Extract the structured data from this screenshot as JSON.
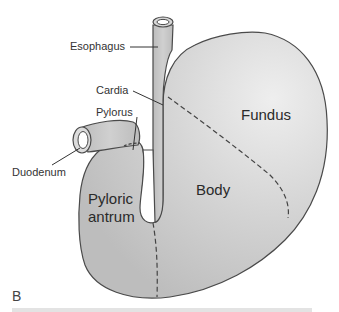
{
  "figure": {
    "panel_letter": "B",
    "colors": {
      "organ_fill": "#c8c8c8",
      "organ_fill_light": "#e6e6e6",
      "outline": "#4a4a4a",
      "leader_line": "#333333",
      "background": "#ffffff"
    },
    "labels": {
      "esophagus": "Esophagus",
      "cardia": "Cardia",
      "pylorus": "Pylorus",
      "duodenum": "Duodenum",
      "fundus": "Fundus",
      "body": "Body",
      "pyloric_antrum_line1": "Pyloric",
      "pyloric_antrum_line2": "antrum"
    }
  }
}
